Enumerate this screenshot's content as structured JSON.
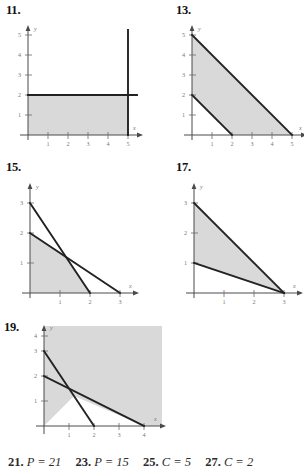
{
  "page": {
    "background": "#ffffff",
    "shade_color": "#d9d9d9",
    "line_color": "#222222",
    "axis_color": "#4a4a4a"
  },
  "panels": [
    {
      "number": "11.",
      "axis": {
        "xlabel": "x",
        "ylabel": "y",
        "xticks": [
          "1",
          "2",
          "3",
          "4",
          "5"
        ],
        "yticks": [
          "1",
          "2",
          "3",
          "4",
          "5"
        ],
        "xmax": 5.6,
        "ymax": 5.6
      },
      "region_vertices": "(0,0) (5,0) (5,2) (0,2)",
      "boundaries": [
        {
          "from": "(0,2)",
          "to": "(5.45,2)",
          "desc": "horizontal line y = 2"
        },
        {
          "from": "(5,0)",
          "to": "(5,5.45)",
          "desc": "vertical line x = 5"
        }
      ]
    },
    {
      "number": "13.",
      "axis": {
        "xlabel": "x",
        "ylabel": "y",
        "xticks": [
          "1",
          "2",
          "3",
          "4",
          "5"
        ],
        "yticks": [
          "1",
          "2",
          "3",
          "4",
          "5"
        ],
        "xmax": 5.6,
        "ymax": 5.6
      },
      "region_vertices": "(0,2) (2,0) (5,0) (0,5)",
      "boundaries": [
        {
          "from": "(0,5)",
          "to": "(5,0)",
          "desc": "line through (0,5) and (5,0)"
        },
        {
          "from": "(0,2)",
          "to": "(2,0)",
          "desc": "line through (0,2) and (2,0)"
        }
      ]
    },
    {
      "number": "15.",
      "axis": {
        "xlabel": "x",
        "ylabel": "y",
        "xticks": [
          "1",
          "2",
          "3"
        ],
        "yticks": [
          "1",
          "2",
          "3"
        ],
        "xmax": 3.5,
        "ymax": 3.4
      },
      "region_vertices": "(0,0) (2,0) (1.2,1.2) (0,2)",
      "boundaries": [
        {
          "from": "(0,3)",
          "to": "(2,0)",
          "desc": "line through (0,3) and (2,0)"
        },
        {
          "from": "(0,2)",
          "to": "(3,0)",
          "desc": "line through (0,2) and (3,0)"
        }
      ],
      "intersection": "(1.2, 1.2)"
    },
    {
      "number": "17.",
      "axis": {
        "xlabel": "x",
        "ylabel": "y",
        "xticks": [
          "1",
          "2",
          "3"
        ],
        "yticks": [
          "1",
          "2",
          "3"
        ],
        "xmax": 3.5,
        "ymax": 3.4
      },
      "region_vertices": "(0,1) (3,0) (0,3)",
      "boundaries": [
        {
          "from": "(0,3)",
          "to": "(3,0)",
          "desc": "line through (0,3) and (3,0)"
        },
        {
          "from": "(0,1)",
          "to": "(3,0)",
          "desc": "line through (0,1) and (3,0)"
        }
      ]
    },
    {
      "number": "19.",
      "axis": {
        "xlabel": "x",
        "ylabel": "y",
        "xticks": [
          "1",
          "2",
          "3",
          "4"
        ],
        "yticks": [
          "1",
          "2",
          "3",
          "4"
        ],
        "xmax": 4.6,
        "ymax": 4.6
      },
      "region_vertices": "unbounded region above (0,3)-(1.2,1.4)-(4,0)",
      "boundaries": [
        {
          "from": "(0,3)",
          "to": "(2,0)",
          "desc": "line through (0,3) and (2,0)"
        },
        {
          "from": "(0,2)",
          "to": "(4,0)",
          "desc": "line through (0,2) and (4,0)"
        }
      ],
      "intersection": "(1.2, 1.4)"
    }
  ],
  "answers": [
    {
      "number": "21.",
      "value": "P = 21"
    },
    {
      "number": "23.",
      "value": "P = 15"
    },
    {
      "number": "25.",
      "value": "C = 5"
    },
    {
      "number": "27.",
      "value": "C = 2"
    }
  ]
}
